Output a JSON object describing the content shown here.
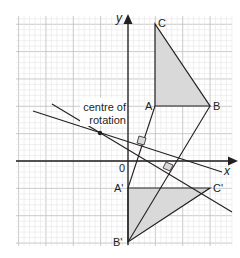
{
  "diagram": {
    "type": "geometry-rotation",
    "axes": {
      "x_label": "x",
      "y_label": "y",
      "origin_label": "0"
    },
    "annotation": {
      "line1": "centre of",
      "line2": "rotation"
    },
    "triangle_original": {
      "vertices": [
        {
          "label": "A",
          "px": [
            155,
            106
          ]
        },
        {
          "label": "B",
          "px": [
            210,
            106
          ]
        },
        {
          "label": "C",
          "px": [
            155,
            24
          ]
        }
      ],
      "fill": "#d9d9d9"
    },
    "triangle_image": {
      "vertices": [
        {
          "label": "A'",
          "px": [
            128,
            188
          ]
        },
        {
          "label": "B'",
          "px": [
            128,
            242
          ]
        },
        {
          "label": "C'",
          "px": [
            210,
            188
          ]
        }
      ],
      "fill": "#d9d9d9"
    },
    "centre_of_rotation_px": [
      100,
      133
    ],
    "colors": {
      "grid_minor": "#e6e6e6",
      "grid_major": "#c4c4c4",
      "line": "#231f20",
      "shade": "#d9d9d9"
    }
  }
}
